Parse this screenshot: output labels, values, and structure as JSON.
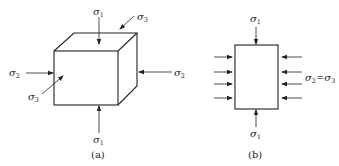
{
  "figure_a": {
    "caption": "(a)",
    "labels": {
      "sigma1_top": {
        "sym": "σ",
        "sub": "1"
      },
      "sigma3_top": {
        "sym": "σ",
        "sub": "3"
      },
      "sigma2_left": {
        "sym": "σ",
        "sub": "2"
      },
      "sigma2_right": {
        "sym": "σ",
        "sub": "2"
      },
      "sigma3_front": {
        "sym": "σ",
        "sub": "3"
      },
      "sigma1_bottom": {
        "sym": "σ",
        "sub": "1"
      }
    }
  },
  "figure_b": {
    "caption": "(b)",
    "labels": {
      "sigma1_top": {
        "sym": "σ",
        "sub": "1"
      },
      "sigma1_bottom": {
        "sym": "σ",
        "sub": "1"
      },
      "lateral": {
        "sym_a": "σ",
        "sub_a": "2",
        "eq": "=",
        "sym_b": "σ",
        "sub_b": "3"
      }
    }
  },
  "colors": {
    "line": "#222222",
    "background": "#ffffff"
  }
}
